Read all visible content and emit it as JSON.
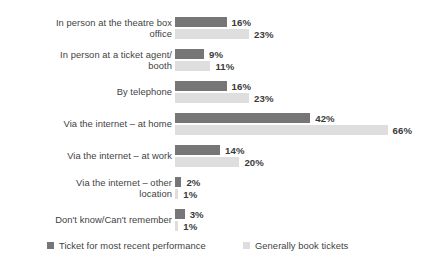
{
  "chart_data": {
    "type": "bar",
    "orientation": "horizontal",
    "title": "",
    "subtitle": "",
    "xlabel": "",
    "ylabel": "",
    "grid": false,
    "value_suffix": "%",
    "xlim": [
      0,
      70
    ],
    "legend_position": "bottom",
    "categories": [
      "In person at the theatre box\noffice",
      "In person at a ticket agent/\nbooth",
      "By telephone",
      "Via the internet – at home",
      "Via the internet – at work",
      "Via the internet – other\nlocation",
      "Don't know/Can't remember"
    ],
    "series": [
      {
        "name": "Ticket for most recent performance",
        "color": "#767676",
        "values": [
          16,
          9,
          16,
          42,
          14,
          2,
          3
        ],
        "labels": [
          "16%",
          "9%",
          "16%",
          "42%",
          "14%",
          "2%",
          "3%"
        ]
      },
      {
        "name": "Generally book tickets",
        "color": "#dedede",
        "values": [
          23,
          11,
          23,
          66,
          20,
          1,
          1
        ],
        "labels": [
          "23%",
          "11%",
          "23%",
          "66%",
          "20%",
          "1%",
          "1%"
        ]
      }
    ]
  },
  "legend": {
    "items": [
      {
        "label": "Ticket for most recent performance",
        "color": "#767676"
      },
      {
        "label": "Generally book tickets",
        "color": "#dedede"
      }
    ]
  }
}
